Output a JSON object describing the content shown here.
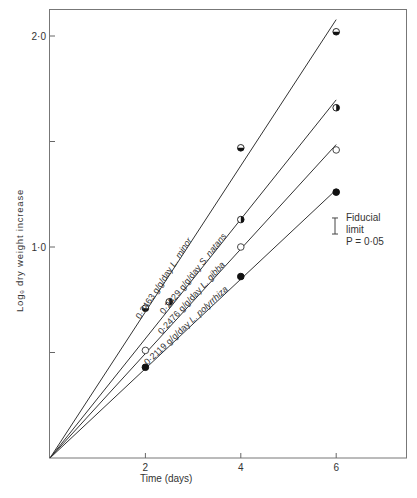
{
  "chart_data": {
    "type": "line",
    "title": "",
    "xlabel": "Time (days)",
    "ylabel": "Logₑ dry weight increase",
    "xlim": [
      0,
      7.5
    ],
    "ylim": [
      0,
      2.13
    ],
    "x_ticks": [
      2,
      4,
      6
    ],
    "x_tick_labels": [
      "2",
      "4",
      "6"
    ],
    "y_ticks": [
      0.5,
      1.0,
      1.5,
      2.0
    ],
    "y_tick_labels": [
      "",
      "1·0",
      "",
      "2·0"
    ],
    "grid": false,
    "series": [
      {
        "name": "L. minor",
        "rate_label": "0·3463 g/g/day",
        "species_label": "L. minor",
        "slope": 0.3463,
        "marker": "circle-bottom-half-filled",
        "points": [
          [
            2,
            0.71
          ],
          [
            4,
            1.47
          ],
          [
            6,
            2.02
          ]
        ]
      },
      {
        "name": "S. natans",
        "rate_label": "0·2829 g/g/day",
        "species_label": "S. natans",
        "slope": 0.2829,
        "marker": "circle-right-half-filled",
        "points": [
          [
            2.5,
            0.74
          ],
          [
            4,
            1.13
          ],
          [
            6,
            1.66
          ]
        ]
      },
      {
        "name": "L. gibba",
        "rate_label": "0·2476 g/g/day",
        "species_label": "L. gibba",
        "slope": 0.2476,
        "marker": "circle-open",
        "points": [
          [
            2,
            0.51
          ],
          [
            4,
            1.0
          ],
          [
            6,
            1.46
          ]
        ]
      },
      {
        "name": "L. polyrrhiza",
        "rate_label": "0·2119 g/g/day",
        "species_label": "L. polyrrhiza",
        "slope": 0.2119,
        "marker": "circle-filled",
        "points": [
          [
            2,
            0.43
          ],
          [
            4,
            0.86
          ],
          [
            6,
            1.26
          ]
        ]
      }
    ],
    "annotations": [
      {
        "type": "error-bar-legend",
        "lines": [
          "Fiducial",
          "limit",
          "P = 0·05"
        ],
        "half_height": 0.038
      }
    ]
  },
  "fiducial": {
    "line1": "Fiducial",
    "line2": "limit",
    "line3": "P = 0·05"
  },
  "axes": {
    "xlabel": "Time (days)",
    "ylabel": "Logₑ dry weight increase"
  }
}
